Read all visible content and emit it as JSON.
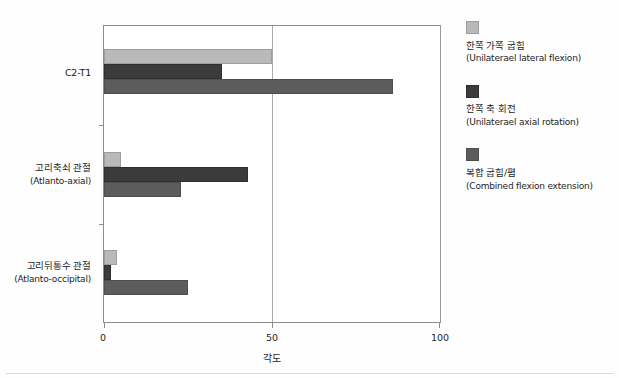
{
  "chart_data": {
    "type": "bar",
    "orientation": "horizontal",
    "title": "",
    "xlabel": "각도",
    "ylabel": "",
    "xlim": [
      0,
      100
    ],
    "xticks": [
      0,
      50,
      100
    ],
    "xtick_labels": [
      "0",
      "50",
      "100"
    ],
    "grid": "vertical-at-50-only",
    "legend_position": "right",
    "categories": [
      {
        "ko": "C2-T1",
        "en": ""
      },
      {
        "ko": "고리축쇠 관절",
        "en": "(Atlanto-axial)"
      },
      {
        "ko": "고리뒤통수 관절",
        "en": "(Atlanto-occipital)"
      }
    ],
    "category_labels": [
      "C2-T1",
      "고리축쇠 관절 (Atlanto-axial)",
      "고리뒤통수 관절 (Atlanto-occipital)"
    ],
    "series": [
      {
        "name": "한쪽 가쪽 굽힘",
        "name_en": "(Unilaterael lateral flexion)",
        "color": "#b9b9b9",
        "values": [
          50,
          5,
          4
        ]
      },
      {
        "name": "한쪽 축 회전",
        "name_en": "(Unilaterael axial rotation)",
        "color": "#3b3b3b",
        "values": [
          35,
          43,
          2
        ]
      },
      {
        "name": "복합 굽힘/폄",
        "name_en": "(Combined flexion extension)",
        "color": "#5c5c5c",
        "values": [
          86,
          23,
          25
        ]
      }
    ]
  },
  "axis": {
    "x_title": "각도",
    "tick_0": "0",
    "tick_50": "50",
    "tick_100": "100"
  },
  "legend": {
    "items": [
      {
        "ko": "한쪽 가쪽 굽힘",
        "en": "(Unilaterael lateral flexion)"
      },
      {
        "ko": "한쪽 축 회전",
        "en": "(Unilaterael axial rotation)"
      },
      {
        "ko": "복합 굽힘/폄",
        "en": "(Combined flexion extension)"
      }
    ]
  },
  "colors": {
    "series_0": "#b9b9b9",
    "series_1": "#3b3b3b",
    "series_2": "#5c5c5c",
    "axis": "#8c8c8c",
    "background": "#ffffff"
  }
}
